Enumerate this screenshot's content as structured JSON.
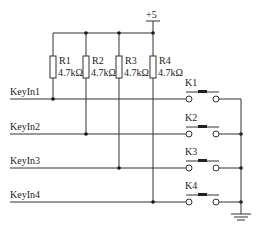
{
  "diagram": {
    "type": "keypad-circuit",
    "supply": {
      "label": "+5"
    },
    "resistors": [
      {
        "name": "R1",
        "value": "4.7kΩ"
      },
      {
        "name": "R2",
        "value": "4.7kΩ"
      },
      {
        "name": "R3",
        "value": "4.7kΩ"
      },
      {
        "name": "R4",
        "value": "4.7kΩ"
      }
    ],
    "inputs": [
      {
        "label": "KeyIn1"
      },
      {
        "label": "KeyIn2"
      },
      {
        "label": "KeyIn3"
      },
      {
        "label": "KeyIn4"
      }
    ],
    "switches": [
      {
        "name": "K1"
      },
      {
        "name": "K2"
      },
      {
        "name": "K3"
      },
      {
        "name": "K4"
      }
    ],
    "ground": {
      "symbol": "ground-icon"
    }
  }
}
